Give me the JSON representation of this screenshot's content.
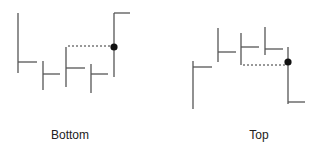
{
  "panels": [
    {
      "id": "bottom",
      "label": "Bottom",
      "label_pos": [
        70,
        128
      ],
      "bars": [
        {
          "x": 18,
          "y1": 13,
          "y2": 73,
          "tick_y": 62,
          "tick_x2": 37
        },
        {
          "x": 43,
          "y1": 61,
          "y2": 90,
          "tick_y": 74,
          "tick_x2": 60
        },
        {
          "x": 66,
          "y1": 47,
          "y2": 87,
          "tick_y": 68,
          "tick_x2": 85
        },
        {
          "x": 91,
          "y1": 64,
          "y2": 93,
          "tick_y": 74,
          "tick_x2": 108
        },
        {
          "x": 114,
          "y1": 13,
          "y2": 77,
          "tick_y": 13,
          "tick_x2": 130
        }
      ],
      "dot": {
        "x": 114,
        "y": 47
      },
      "dashed": {
        "x1": 68,
        "x2": 113,
        "y": 46
      }
    },
    {
      "id": "top",
      "label": "Top",
      "label_pos": [
        259,
        128
      ],
      "bars": [
        {
          "x": 193,
          "y1": 61,
          "y2": 109,
          "tick_y": 67,
          "tick_x2": 212
        },
        {
          "x": 218,
          "y1": 28,
          "y2": 62,
          "tick_y": 52,
          "tick_x2": 236
        },
        {
          "x": 241,
          "y1": 33,
          "y2": 65,
          "tick_y": 47,
          "tick_x2": 259
        },
        {
          "x": 265,
          "y1": 27,
          "y2": 55,
          "tick_y": 49,
          "tick_x2": 283
        },
        {
          "x": 288,
          "y1": 47,
          "y2": 104,
          "tick_y": 102,
          "tick_x2": 305
        }
      ],
      "dot": {
        "x": 288,
        "y": 62
      },
      "dashed": {
        "x1": 243,
        "x2": 287,
        "y": 65
      }
    }
  ],
  "colors": {
    "line": "#555555",
    "dot": "#111111",
    "dashed": "#333333"
  }
}
